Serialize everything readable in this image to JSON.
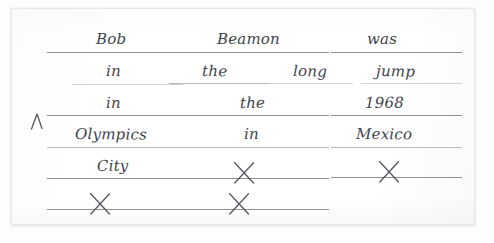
{
  "document": {
    "kind": "handwritten-worksheet",
    "medium": "white paper",
    "ink_color": "#41454b",
    "rule_color": "#8e9196",
    "sentence": "Bob Beamon was in the long jump in the 1968 Olympics in Mexico City"
  },
  "marks": {
    "caret": "∧",
    "caret_name": "insertion-caret",
    "x": "✕"
  },
  "rows": [
    {
      "index": 1,
      "cells": [
        {
          "column": 1,
          "word": "Bob",
          "filled": true,
          "x": 95,
          "y": 31,
          "line_x": 46,
          "line_w": 155,
          "line_y": 51,
          "weight": "normal"
        },
        {
          "column": 2,
          "word": "Beamon",
          "filled": true,
          "x": 216,
          "y": 31,
          "line_x": 186,
          "line_w": 142,
          "line_y": 51,
          "weight": "normal"
        },
        {
          "column": 3,
          "word": "was",
          "filled": true,
          "x": 366,
          "y": 31,
          "line_x": 330,
          "line_w": 131,
          "line_y": 51,
          "weight": "normal"
        }
      ]
    },
    {
      "index": 2,
      "cells": [
        {
          "column": 1,
          "word": "in",
          "filled": true,
          "x": 105,
          "y": 63,
          "line_x": 71,
          "line_w": 111,
          "line_y": 83,
          "weight": "vfaint"
        },
        {
          "column": 2,
          "word": "the",
          "filled": true,
          "x": 201,
          "y": 63,
          "line_x": 168,
          "line_w": 100,
          "line_y": 82,
          "weight": "faint"
        },
        {
          "column": 3,
          "word": "long",
          "filled": true,
          "x": 292,
          "y": 63,
          "line_x": 268,
          "line_w": 84,
          "line_y": 82,
          "weight": "vfaint"
        },
        {
          "column": 4,
          "word": "jump",
          "filled": true,
          "x": 375,
          "y": 63,
          "line_x": 360,
          "line_w": 101,
          "line_y": 82,
          "weight": "vfaint"
        }
      ]
    },
    {
      "index": 3,
      "cells": [
        {
          "column": 1,
          "word": "in",
          "filled": true,
          "x": 105,
          "y": 95,
          "line_x": 46,
          "line_w": 155,
          "line_y": 114,
          "weight": "normal"
        },
        {
          "column": 2,
          "word": "the",
          "filled": true,
          "x": 239,
          "y": 95,
          "line_x": 186,
          "line_w": 142,
          "line_y": 114,
          "weight": "normal"
        },
        {
          "column": 3,
          "word": "1968",
          "filled": true,
          "x": 364,
          "y": 95,
          "line_x": 330,
          "line_w": 131,
          "line_y": 114,
          "weight": "normal"
        }
      ]
    },
    {
      "index": 4,
      "cells": [
        {
          "column": 1,
          "word": "Olympics",
          "filled": true,
          "x": 74,
          "y": 126,
          "line_x": 46,
          "line_w": 155,
          "line_y": 146,
          "weight": "faint"
        },
        {
          "column": 2,
          "word": "in",
          "filled": true,
          "x": 243,
          "y": 126,
          "line_x": 186,
          "line_w": 142,
          "line_y": 146,
          "weight": "faint"
        },
        {
          "column": 3,
          "word": "Mexico",
          "filled": true,
          "x": 355,
          "y": 126,
          "line_x": 330,
          "line_w": 131,
          "line_y": 146,
          "weight": "faint"
        }
      ]
    },
    {
      "index": 5,
      "cells": [
        {
          "column": 1,
          "word": "City",
          "filled": true,
          "x": 96,
          "y": 158,
          "line_x": 46,
          "line_w": 155,
          "line_y": 177,
          "weight": "normal"
        },
        {
          "column": 2,
          "word": null,
          "filled": false,
          "x": 243,
          "y": 158,
          "line_x": 186,
          "line_w": 142,
          "line_y": 177,
          "weight": "normal"
        },
        {
          "column": 3,
          "word": null,
          "filled": false,
          "x": 388,
          "y": 158,
          "line_x": 330,
          "line_w": 131,
          "line_y": 176,
          "weight": "normal"
        }
      ]
    },
    {
      "index": 6,
      "cells": [
        {
          "column": 1,
          "word": null,
          "filled": false,
          "x": 99,
          "y": 190,
          "line_x": 46,
          "line_w": 155,
          "line_y": 208,
          "weight": "normal"
        },
        {
          "column": 2,
          "word": null,
          "filled": false,
          "x": 238,
          "y": 190,
          "line_x": 186,
          "line_w": 142,
          "line_y": 208,
          "weight": "normal"
        }
      ]
    }
  ],
  "caret": {
    "x": 28,
    "y": 110
  }
}
